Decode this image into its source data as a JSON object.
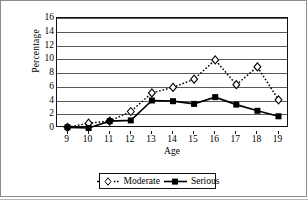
{
  "chart_data": {
    "type": "line",
    "title": "",
    "xlabel": "Age",
    "ylabel": "Percentage",
    "categories": [
      9,
      10,
      11,
      12,
      13,
      14,
      15,
      16,
      17,
      18,
      19
    ],
    "x_tick_labels": [
      "9",
      "10",
      "11",
      "12",
      "13",
      "14",
      "15",
      "16",
      "17",
      "18",
      "19"
    ],
    "y_tick_labels": [
      "16",
      "14",
      "12",
      "10",
      "8",
      "6",
      "4",
      "2",
      "0"
    ],
    "y_ticks": [
      16,
      14,
      12,
      10,
      8,
      6,
      4,
      2,
      0
    ],
    "ylim": [
      0,
      16
    ],
    "xlim": [
      9,
      19
    ],
    "grid": true,
    "legend_position": "bottom-center",
    "series": [
      {
        "name": "Moderate",
        "marker": "diamond-open",
        "line_style": "dotted",
        "color": "#000000",
        "values": [
          0.1,
          0.7,
          1.0,
          2.4,
          5.1,
          5.9,
          7.1,
          9.9,
          6.3,
          8.9,
          4.1
        ]
      },
      {
        "name": "Serious",
        "marker": "square-filled",
        "line_style": "solid",
        "color": "#000000",
        "values": [
          0.1,
          0.0,
          1.0,
          1.1,
          4.0,
          3.9,
          3.5,
          4.5,
          3.4,
          2.5,
          1.7
        ]
      }
    ]
  },
  "legend": {
    "items": [
      {
        "label": "Moderate"
      },
      {
        "label": "Serious"
      }
    ]
  }
}
